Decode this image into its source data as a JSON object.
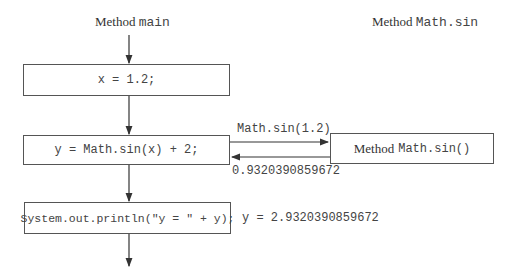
{
  "main_header": {
    "prefix": "Method",
    "name": "main"
  },
  "sin_header": {
    "prefix": "Method",
    "name": "Math.sin"
  },
  "boxes": {
    "assign_x": "x = 1.2;",
    "compute_y": "y = Math.sin(x) + 2;",
    "print": "System.out.println(\"y = \" + y);",
    "sin_method_prefix": "Method",
    "sin_method_name": "Math.sin()"
  },
  "call_label": "Math.sin(1.2)",
  "return_label": "0.9320390859672",
  "output_label": "y = 2.9320390859672",
  "colors": {
    "line": "#333333",
    "text": "#444444"
  }
}
